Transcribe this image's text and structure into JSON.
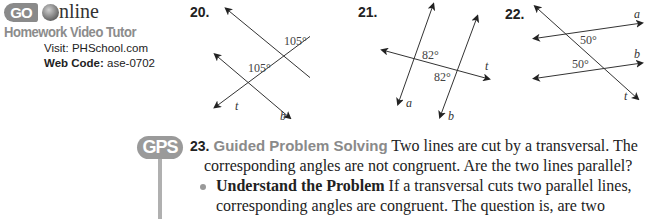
{
  "go_online": {
    "badge": "GO",
    "brand": "nline",
    "tutor": "Homework Video Tutor",
    "visit_label": "Visit:",
    "visit_value": "PHSchool.com",
    "webcode_label": "Web Code:",
    "webcode_value": "ase-0702"
  },
  "exercises": [
    {
      "number": "20.",
      "angle1": "105°",
      "angle2": "105°",
      "labels": {
        "a": "a",
        "b": "b",
        "t": "t"
      }
    },
    {
      "number": "21.",
      "angle1": "82°",
      "angle2": "82°",
      "labels": {
        "a": "a",
        "b": "b",
        "t": "t"
      }
    },
    {
      "number": "22.",
      "angle1": "50°",
      "angle2": "50°",
      "labels": {
        "a": "a",
        "b": "b",
        "t": "t"
      }
    }
  ],
  "problem23": {
    "badge": "GPS",
    "number": "23.",
    "title": "Guided Problem Solving",
    "line1": " Two lines are cut by a transversal. The",
    "line2": "corresponding angles are not congruent. Are the two lines parallel?",
    "step_title": "Understand the Problem",
    "line3": " If a transversal cuts two parallel lines,",
    "line4": "corresponding angles are congruent. The question is, are two"
  }
}
